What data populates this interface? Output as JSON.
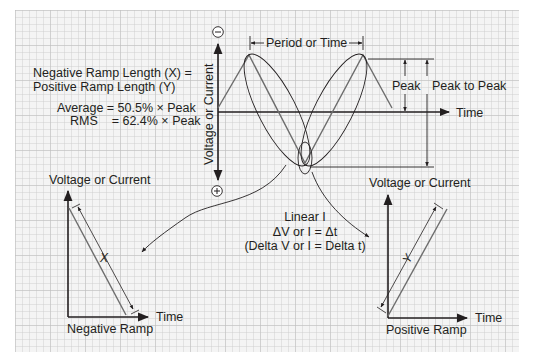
{
  "figure": {
    "type": "diagram",
    "colors": {
      "paper": "#f4f4f4",
      "grid_line": "#c9c9c9",
      "ink": "#231f20",
      "waveform": "#6d6d6d"
    }
  },
  "left_notes": {
    "line1": "Negative Ramp Length (X) =",
    "line2": "Positive Ramp Length (Y)",
    "average": "Average = 50.5% × Peak",
    "rms": "RMS    = 62.4% × Peak"
  },
  "main_graph": {
    "y_axis_label": "Voltage or Current",
    "x_axis_label": "Time",
    "negative_symbol": "−",
    "positive_symbol": "+",
    "period_label": "Period or Time",
    "peak_label": "Peak",
    "peak_to_peak_label": "Peak to Peak"
  },
  "center_notes": {
    "line1": "Linear I",
    "line2": "ΔV or I = Δt",
    "line3": "(Delta V or I = Delta t)"
  },
  "negative_ramp": {
    "y_axis_label": "Voltage or Current",
    "x_axis_label": "Time",
    "title": "Negative Ramp",
    "length_symbol": "X"
  },
  "positive_ramp": {
    "y_axis_label": "Voltage or Current",
    "x_axis_label": "Time",
    "title": "Positive Ramp",
    "length_symbol": "Y"
  },
  "values": {
    "average_pct_of_peak": 50.5,
    "rms_pct_of_peak": 62.4
  }
}
